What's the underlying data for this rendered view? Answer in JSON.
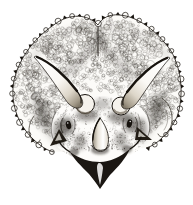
{
  "figure": {
    "title": "Triceratops head, front view - ink illustration",
    "alt": "Black-and-white ink drawing of a Triceratops head seen head-on: a broad scalloped neck frill covered in pebbly scales with a central furrow, two long brow horns curving up and outward from round bosses above the eyes, a short conical nose horn with a ringed base, small jugal cheek horns, and a dark pointed parrot-like beak at the bottom.",
    "palette": {
      "ink": "#17130e",
      "paper": "#ffffff",
      "shade": "#25201a",
      "bump": "#fdfcf9",
      "beak": "#1b1713"
    }
  }
}
